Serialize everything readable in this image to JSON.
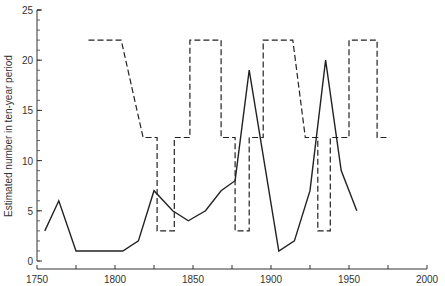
{
  "chart_data": {
    "type": "line",
    "title": "",
    "xlabel": "",
    "ylabel": "Estimated number in ten-year period",
    "xlim": [
      1750,
      2000
    ],
    "ylim": [
      0,
      25
    ],
    "grid": false,
    "legend": null,
    "x_ticks": [
      1750,
      1800,
      1850,
      1900,
      1950,
      2000
    ],
    "x_minor_ticks": [
      1775,
      1825,
      1875,
      1925,
      1975
    ],
    "y_ticks": [
      0,
      5,
      10,
      15,
      20,
      25
    ],
    "y_minor_step": 1,
    "series": [
      {
        "name": "solid",
        "style": "solid",
        "x": [
          1755,
          1764,
          1775,
          1805,
          1815,
          1825,
          1837,
          1847,
          1858,
          1868,
          1877,
          1886,
          1905,
          1915,
          1925,
          1935,
          1945,
          1955
        ],
        "y": [
          3,
          6,
          1,
          1,
          2,
          7,
          5,
          4,
          5,
          7,
          8,
          19,
          1,
          2,
          7,
          20,
          9,
          5
        ]
      },
      {
        "name": "dashed",
        "style": "dashed",
        "x": [
          1783,
          1804,
          1818,
          1827,
          1827,
          1838,
          1838,
          1848,
          1848,
          1868,
          1868,
          1877,
          1877,
          1886,
          1886,
          1895,
          1895,
          1914,
          1922,
          1930,
          1930,
          1938,
          1938,
          1950,
          1950,
          1968,
          1968,
          1976
        ],
        "y": [
          22,
          22,
          12.3,
          12.3,
          3,
          3,
          12.3,
          12.3,
          22,
          22,
          12.3,
          12.3,
          3,
          3,
          12.3,
          12.3,
          22,
          22,
          12.3,
          12.3,
          3,
          3,
          12.3,
          12.3,
          22,
          22,
          12.3,
          12.3
        ]
      }
    ]
  },
  "axes": {
    "y_title": "Estimated number in ten-year period",
    "x_tick_labels": [
      "1750",
      "1800",
      "1850",
      "1900",
      "1950",
      "2000"
    ],
    "y_tick_labels": [
      "0",
      "5",
      "10",
      "15",
      "20",
      "25"
    ]
  }
}
